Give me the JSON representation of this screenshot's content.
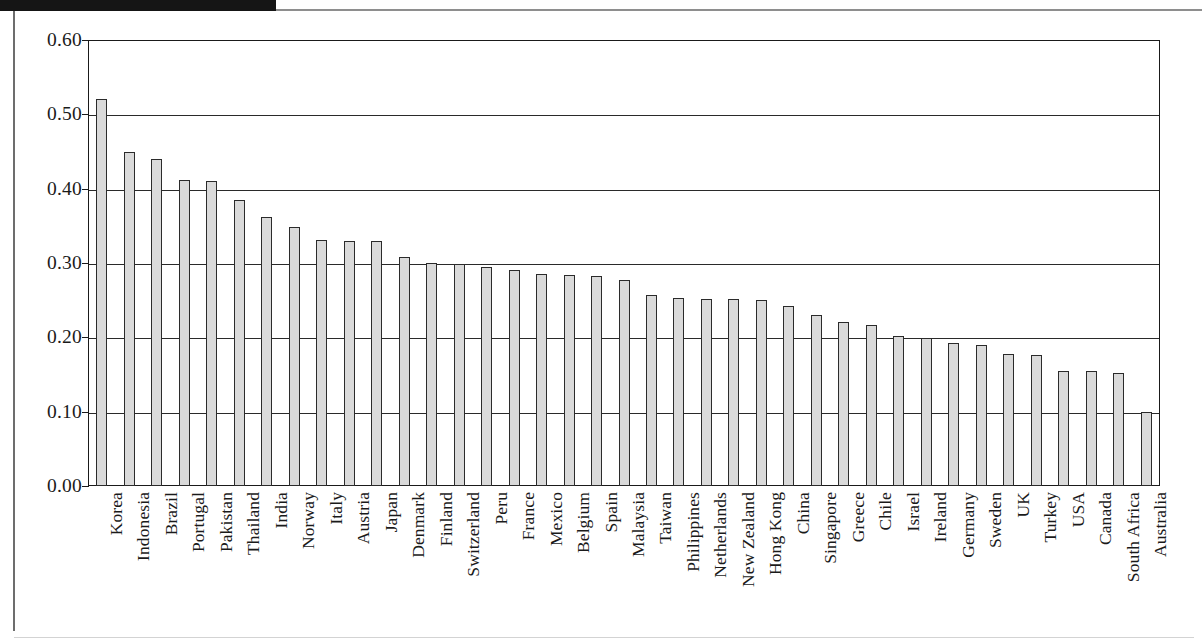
{
  "chart_data": {
    "type": "bar",
    "title": "",
    "subtitle": "",
    "xlabel": "",
    "ylabel": "",
    "ylim": [
      0.0,
      0.6
    ],
    "ytick_labels": [
      "0.00",
      "0.10",
      "0.20",
      "0.30",
      "0.40",
      "0.50",
      "0.60"
    ],
    "ytick_values": [
      0.0,
      0.1,
      0.2,
      0.3,
      0.4,
      0.5,
      0.6
    ],
    "grid": "horizontal",
    "legend": "none",
    "bar_fill_color": "#dadada",
    "bar_edge_color": "#2b2b2b",
    "categories": [
      "Korea",
      "Indonesia",
      "Brazil",
      "Portugal",
      "Pakistan",
      "Thailand",
      "India",
      "Norway",
      "Italy",
      "Austria",
      "Japan",
      "Denmark",
      "Finland",
      "Switzerland",
      "Peru",
      "France",
      "Mexico",
      "Belgium",
      "Spain",
      "Malaysia",
      "Taiwan",
      "Philippines",
      "Netherlands",
      "New Zealand",
      "Hong Kong",
      "China",
      "Singapore",
      "Greece",
      "Chile",
      "Israel",
      "Ireland",
      "Germany",
      "Sweden",
      "UK",
      "Turkey",
      "USA",
      "Canada",
      "South Africa",
      "Australia"
    ],
    "values": [
      0.52,
      0.45,
      0.44,
      0.412,
      0.411,
      0.385,
      0.362,
      0.349,
      0.331,
      0.33,
      0.329,
      0.308,
      0.3,
      0.299,
      0.294,
      0.29,
      0.285,
      0.284,
      0.282,
      0.277,
      0.257,
      0.253,
      0.252,
      0.252,
      0.25,
      0.242,
      0.23,
      0.22,
      0.217,
      0.202,
      0.199,
      0.192,
      0.19,
      0.177,
      0.176,
      0.155,
      0.155,
      0.152,
      0.1
    ]
  },
  "annotations": {
    "scan_artifact": "dark-band-top-left"
  }
}
